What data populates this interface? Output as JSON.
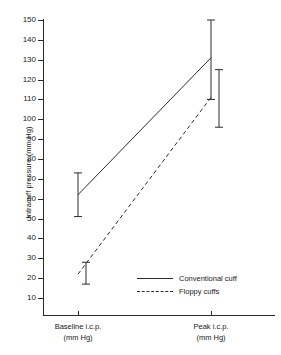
{
  "chart_data": {
    "type": "line",
    "title": "",
    "xlabel": "",
    "ylabel": "Intracuff pressure (mm Hg)",
    "categories": [
      "Baseline i.c.p.\n(mm Hg)",
      "Peak i.c.p.\n(mm Hg)"
    ],
    "category_labels": [
      {
        "line1": "Baseline i.c.p.",
        "line2": "(mm Hg)"
      },
      {
        "line1": "Peak i.c.p.",
        "line2": "(mm Hg)"
      }
    ],
    "ylim": [
      0,
      150
    ],
    "yticks": [
      150,
      140,
      130,
      120,
      110,
      100,
      90,
      80,
      70,
      60,
      50,
      40,
      30,
      20,
      10
    ],
    "grid": false,
    "legend_position": "inside-bottom-right",
    "series": [
      {
        "name": "Conventional cuff",
        "style": "solid",
        "color": "#2b2b2b",
        "values": [
          62,
          131
        ],
        "errors_low": [
          51,
          110
        ],
        "errors_high": [
          73,
          150
        ]
      },
      {
        "name": "Floppy cuffs",
        "style": "dashed",
        "color": "#2b2b2b",
        "values": [
          22,
          111
        ],
        "errors_low": [
          17,
          96
        ],
        "errors_high": [
          28,
          125
        ]
      }
    ]
  },
  "axis": {
    "y_label": "Intracuff pressure (mm Hg)",
    "tick_labels": [
      "150",
      "140",
      "130",
      "120",
      "110",
      "100",
      "90",
      "80",
      "70",
      "60",
      "50",
      "40",
      "30",
      "20",
      "10"
    ]
  },
  "legend": {
    "items": [
      {
        "label": "Conventional cuff",
        "style": "solid"
      },
      {
        "label": "Floppy cuffs",
        "style": "dashed"
      }
    ]
  },
  "xaxis": {
    "cat1_line1": "Baseline i.c.p.",
    "cat1_line2": "(mm Hg)",
    "cat2_line1": "Peak i.c.p.",
    "cat2_line2": "(mm Hg)"
  }
}
